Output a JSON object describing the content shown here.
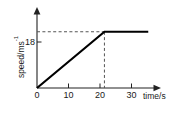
{
  "chart_data": {
    "type": "line",
    "title": "",
    "xlabel": "time/s",
    "ylabel": "speed/ms",
    "ylabel_superscript": "-1",
    "x": [
      0,
      20,
      33
    ],
    "values": [
      0,
      18,
      18
    ],
    "xlim": [
      0,
      35
    ],
    "ylim": [
      0,
      24
    ],
    "xticks": [
      "0",
      "10",
      "20",
      "30"
    ],
    "xtick_values": [
      0,
      10,
      20,
      30
    ],
    "yticks": [
      "18"
    ],
    "ytick_values": [
      18
    ],
    "grid": false,
    "legend": "none",
    "annotations": [
      {
        "name": "horizontal-guide-at-18",
        "kind": "dashed-line",
        "from": [
          0,
          18
        ],
        "to": [
          20,
          18
        ]
      },
      {
        "name": "vertical-guide-at-20",
        "kind": "dashed-line",
        "from": [
          20,
          18
        ],
        "to": [
          20,
          0
        ]
      }
    ]
  },
  "axes": {
    "y_label_main": "speed/ms",
    "y_label_sup": "-1",
    "y_tick_18": "18",
    "x_label": "time/s",
    "x_tick_0": "0",
    "x_tick_10": "10",
    "x_tick_20": "20",
    "x_tick_30": "30"
  },
  "colors": {
    "background": "#ffffff",
    "axis": "#222222",
    "series": "#000000",
    "guide": "#555555",
    "text": "#1a1a1a"
  }
}
